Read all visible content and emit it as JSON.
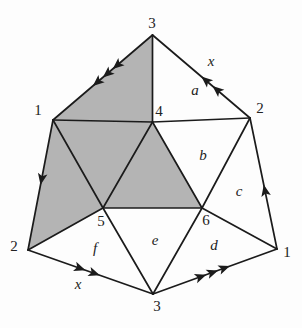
{
  "diagram": {
    "description_colors": {
      "background": "#fdfdfd",
      "line": "#1b1b1b",
      "shade": "#b4b4b4",
      "label": "#222222"
    },
    "vertex_labels": {
      "outer_top": "3",
      "outer_top_right": "2",
      "outer_right": "1",
      "outer_bottom": "3",
      "outer_bottom_left": "2",
      "outer_left": "1",
      "inner_top": "4",
      "inner_bottom_left": "5",
      "inner_bottom_right": "6"
    },
    "face_labels": {
      "a": "a",
      "b": "b",
      "c": "c",
      "d": "d",
      "e": "e",
      "f": "f"
    },
    "edge_labels": {
      "top_right_x": "x",
      "bottom_left_x": "x"
    }
  }
}
